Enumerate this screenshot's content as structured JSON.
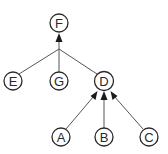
{
  "diagram": {
    "type": "tree",
    "nodes": [
      {
        "id": "F",
        "label": "F",
        "x": 59,
        "y": 23
      },
      {
        "id": "E",
        "label": "E",
        "x": 13,
        "y": 81
      },
      {
        "id": "G",
        "label": "G",
        "x": 59,
        "y": 81
      },
      {
        "id": "D",
        "label": "D",
        "x": 104,
        "y": 81
      },
      {
        "id": "A",
        "label": "A",
        "x": 61,
        "y": 137
      },
      {
        "id": "B",
        "label": "B",
        "x": 104,
        "y": 137
      },
      {
        "id": "C",
        "label": "C",
        "x": 149,
        "y": 137
      }
    ],
    "edges": [
      {
        "from": "E",
        "to": "F",
        "via_junction": true
      },
      {
        "from": "G",
        "to": "F",
        "via_junction": true
      },
      {
        "from": "D",
        "to": "F",
        "via_junction": true
      },
      {
        "from": "A",
        "to": "D",
        "arrow": true
      },
      {
        "from": "B",
        "to": "D",
        "arrow": true
      },
      {
        "from": "C",
        "to": "D",
        "arrow": true
      }
    ],
    "colors": {
      "stroke": "#2a2a2a",
      "edge": "#555555",
      "background": "#ffffff"
    }
  }
}
